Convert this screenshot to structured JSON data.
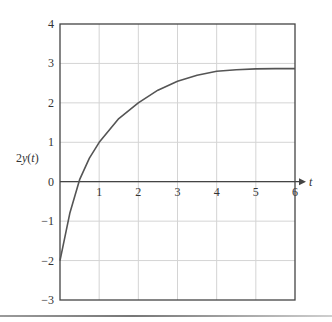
{
  "chart_data": {
    "type": "line",
    "title": "",
    "xlabel": "t",
    "ylabel": "2y(t)",
    "xlim": [
      0,
      6
    ],
    "ylim": [
      -3,
      4
    ],
    "grid": true,
    "legend": null,
    "x_ticks": [
      "1",
      "2",
      "3",
      "4",
      "5",
      "6"
    ],
    "y_ticks": [
      "4",
      "3",
      "2",
      "1",
      "0",
      "-1",
      "-2",
      "-3"
    ],
    "series": [
      {
        "name": "2y(t)",
        "x": [
          0,
          0.25,
          0.5,
          0.75,
          1,
          1.5,
          2,
          2.5,
          3,
          3.5,
          4,
          4.5,
          5,
          5.5,
          6
        ],
        "values": [
          -2,
          -0.8,
          0.05,
          0.6,
          1.0,
          1.6,
          2.0,
          2.32,
          2.55,
          2.7,
          2.8,
          2.84,
          2.86,
          2.87,
          2.87
        ]
      }
    ],
    "asymptote": 2.87
  },
  "colors": {
    "curve": "#555555",
    "grid": "#d4d4d4",
    "frame": "#444444",
    "text": "#333333"
  }
}
